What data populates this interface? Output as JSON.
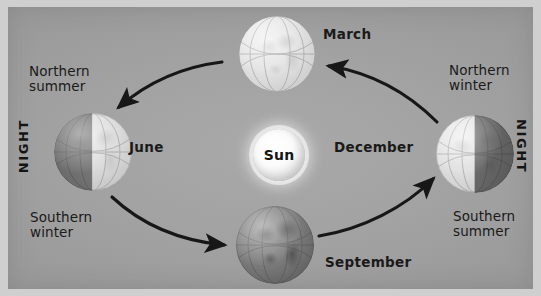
{
  "diagram": {
    "background_color": "#a2a2a2",
    "frame_color": "#cfcfcf",
    "center": {
      "name": "sun",
      "label": "Sun",
      "color": "#ffffff"
    },
    "positions": [
      {
        "id": "march",
        "month_label": "March",
        "season_label": "",
        "lit": "full",
        "note": "top of orbit, bright globe"
      },
      {
        "id": "june",
        "month_label": "June",
        "season_label_top": "Northern\nsummer",
        "season_label_bottom": "Southern\nwinter",
        "lit": "right-half",
        "note": "left of orbit, night on left side"
      },
      {
        "id": "september",
        "month_label": "September",
        "season_label": "",
        "lit": "full",
        "note": "bottom of orbit, dark globe"
      },
      {
        "id": "december",
        "month_label": "December",
        "season_label_top": "Northern\nwinter",
        "season_label_bottom": "Southern\nsummer",
        "lit": "left-half",
        "note": "right of orbit, night on right side"
      }
    ],
    "night_labels": [
      {
        "id": "night-left",
        "text": "NIGHT",
        "orientation": "bottom-to-top"
      },
      {
        "id": "night-right",
        "text": "NIGHT",
        "orientation": "top-to-bottom"
      }
    ],
    "arrows": [
      {
        "id": "arrow-march-to-june",
        "from": "March",
        "to": "June",
        "direction": "counterclockwise"
      },
      {
        "id": "arrow-june-to-september",
        "from": "June",
        "to": "September",
        "direction": "counterclockwise"
      },
      {
        "id": "arrow-september-to-december",
        "from": "September",
        "to": "December",
        "direction": "counterclockwise"
      },
      {
        "id": "arrow-december-to-march",
        "from": "December",
        "to": "March",
        "direction": "counterclockwise"
      }
    ],
    "arrow_color": "#1a1a1a",
    "text_color": "#1a1a1a"
  }
}
